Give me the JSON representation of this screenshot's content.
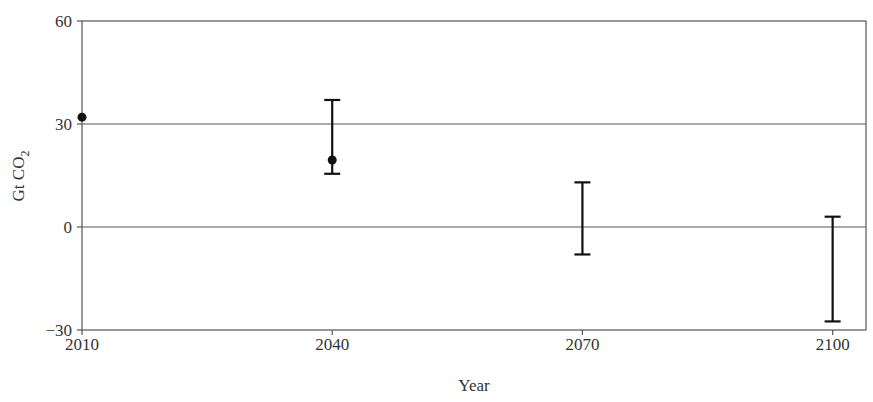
{
  "chart_data": {
    "type": "scatter",
    "title": "",
    "xlabel": "Year",
    "ylabel": "Gt CO2",
    "ylabel_parts": {
      "main": "Gt CO",
      "sub": "2"
    },
    "xlim": [
      2010,
      2104
    ],
    "ylim": [
      -30,
      60
    ],
    "x_ticks": [
      "2010",
      "2040",
      "2070",
      "2100"
    ],
    "y_ticks": [
      "60",
      "30",
      "0",
      "−30"
    ],
    "grid": "horizontal reference lines at 30 and 0",
    "points": [
      {
        "x": 2010,
        "y": 32
      },
      {
        "x": 2040,
        "y": 19.5
      }
    ],
    "error_bars": [
      {
        "x": 2040,
        "low": 15.5,
        "high": 37
      },
      {
        "x": 2070,
        "low": -8,
        "high": 13
      },
      {
        "x": 2100,
        "low": -27.5,
        "high": 3
      }
    ],
    "legend": null
  }
}
